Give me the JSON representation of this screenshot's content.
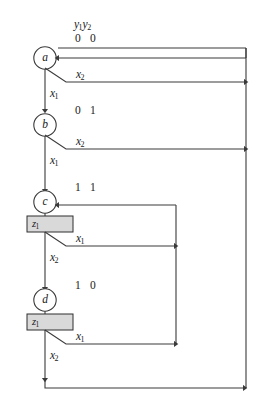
{
  "diagram": {
    "type": "state-flow-chart",
    "header": {
      "state_vars_label": "y",
      "state_vars_sub1": "1",
      "state_vars_label2": "y",
      "state_vars_sub2": "2"
    },
    "colors": {
      "line": "#3a3a3a",
      "text": "#1a1a1a",
      "box_fill": "#d9d9d9",
      "box_stroke": "#2e2e2e",
      "background": "#ffffff"
    },
    "states": [
      {
        "id": "a",
        "letter": "a",
        "encoding": "0 0",
        "output": null,
        "branch_label": "x",
        "branch_sub": "2",
        "continue_label": "x",
        "continue_sub": "1"
      },
      {
        "id": "b",
        "letter": "b",
        "encoding": "0 1",
        "output": null,
        "branch_label": "x",
        "branch_sub": "2",
        "continue_label": "x",
        "continue_sub": "1"
      },
      {
        "id": "c",
        "letter": "c",
        "encoding": "1 1",
        "output": "z",
        "output_sub": "1",
        "branch_label": "x",
        "branch_sub": "1",
        "continue_label": "x",
        "continue_sub": "2"
      },
      {
        "id": "d",
        "letter": "d",
        "encoding": "1 0",
        "output": "z",
        "output_sub": "1",
        "branch_label": "x",
        "branch_sub": "1",
        "continue_label": "x",
        "continue_sub": "2"
      }
    ],
    "edge_labels": {
      "a_branch": "x",
      "a_branch_sub": "2",
      "a_to_b": "x",
      "a_to_b_sub": "1",
      "b_branch": "x",
      "b_branch_sub": "2",
      "b_to_c": "x",
      "b_to_c_sub": "1",
      "c_branch": "x",
      "c_branch_sub": "1",
      "c_to_d": "x",
      "c_to_d_sub": "2",
      "d_branch": "x",
      "d_branch_sub": "1",
      "d_exit": "x",
      "d_exit_sub": "2"
    }
  }
}
